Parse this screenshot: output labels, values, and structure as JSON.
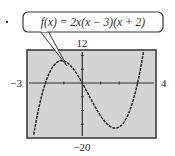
{
  "chart_data": {
    "type": "line",
    "title": "f(x) = 2x(x − 3)(x + 2)",
    "function": "2x(x-3)(x+2)",
    "xlabel": "",
    "ylabel": "",
    "xlim": [
      -3,
      4
    ],
    "ylim": [
      -20,
      12
    ],
    "x_tick_labels": {
      "min": "−3",
      "max": "4"
    },
    "y_tick_labels": {
      "max": "12",
      "min": "−20"
    },
    "grid": false,
    "x_tick_step": 1,
    "y_tick_step": 5,
    "series": [
      {
        "name": "f(x)",
        "x": [
          -3,
          -2.5,
          -2,
          -1.5,
          -1.2,
          -1,
          -0.5,
          0,
          0.5,
          1,
          1.5,
          2,
          2.5,
          3,
          3.5,
          4
        ],
        "values": [
          -36,
          -16.25,
          0,
          7.88,
          8.95,
          8,
          5.25,
          0,
          -5.25,
          -12,
          -15.75,
          -16,
          -11.25,
          0,
          19.25,
          48
        ]
      }
    ],
    "colors": {
      "screen": "#d4d4d4",
      "curve": "#2a2a2a",
      "frame": "#333333"
    }
  },
  "callout": {
    "label": "f(x) = 2x(x − 3)(x + 2)"
  },
  "labels": {
    "ymax": "12",
    "ymin": "−20",
    "xmin": "−3",
    "xmax": "4"
  }
}
